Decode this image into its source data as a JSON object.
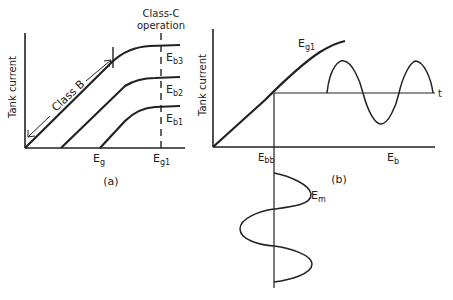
{
  "panel_a": {
    "caption": "(a)",
    "y_axis_label": "Tank current",
    "class_b_label": "Class B",
    "class_c_label_line1": "Class-C",
    "class_c_label_line2": "operation",
    "x_tick_eg": "E",
    "x_tick_eg_sub": "g",
    "x_tick_eg1": "E",
    "x_tick_eg1_sub": "g1",
    "curves": [
      {
        "label": "E",
        "sub": "b3"
      },
      {
        "label": "E",
        "sub": "b2"
      },
      {
        "label": "E",
        "sub": "b1"
      }
    ]
  },
  "panel_b": {
    "caption": "(b)",
    "y_axis_label": "Tank current",
    "curve_label": "E",
    "curve_label_sub": "g1",
    "x_tick_ebb": "E",
    "x_tick_ebb_sub": "bb",
    "x_axis_label": "E",
    "x_axis_label_sub": "b",
    "time_label": "t",
    "mod_label": "E",
    "mod_label_sub": "m"
  },
  "colors": {
    "ink": "#222222",
    "background": "#ffffff"
  }
}
